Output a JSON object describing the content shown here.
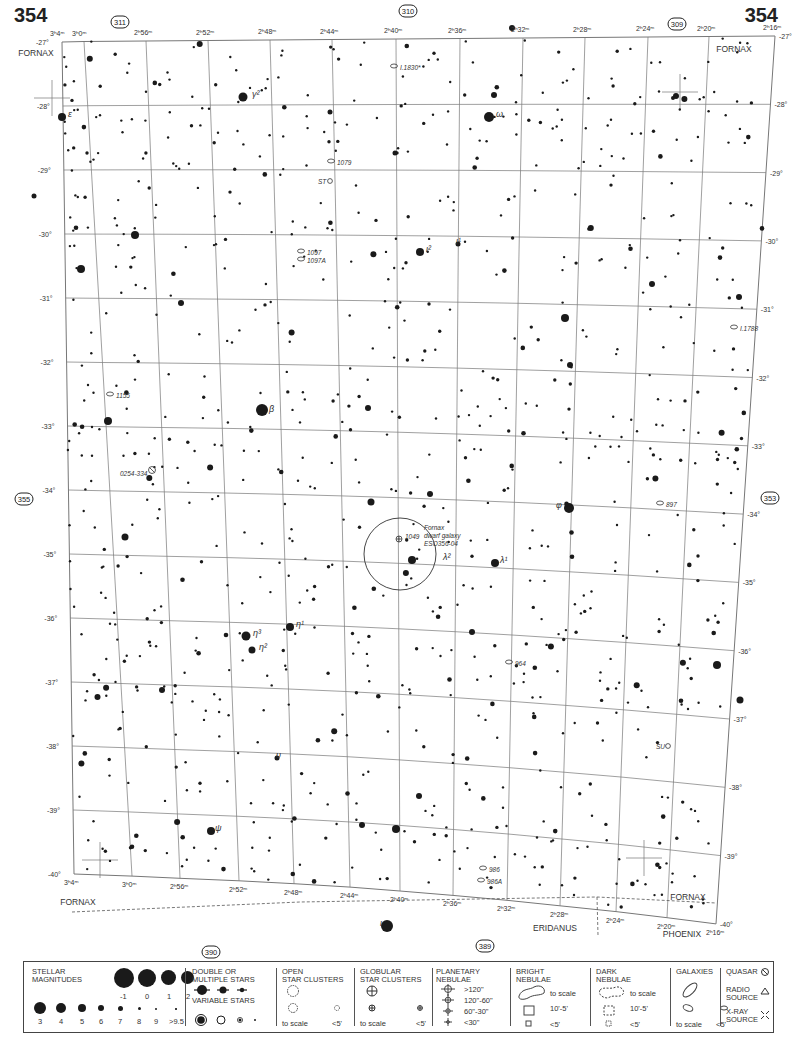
{
  "page": {
    "number_left": "354",
    "number_right": "354"
  },
  "adjacent_charts": {
    "top_left": "311",
    "top_center": "310",
    "top_right": "309",
    "left": "355",
    "right": "353",
    "bottom_left": "390",
    "bottom_right": "389"
  },
  "ra_labels_top": [
    "3h4m",
    "3h0m",
    "2h56m",
    "2h52m",
    "2h48m",
    "2h44m",
    "2h40m",
    "2h36m",
    "2h32m",
    "2h28m",
    "2h24m",
    "2h20m",
    "2h16m"
  ],
  "ra_labels_bottom": [
    "3h4m",
    "3h0m",
    "2h56m",
    "2h52m",
    "2h48m",
    "2h44m",
    "2h40m",
    "2h36m",
    "2h32m",
    "2h28m",
    "2h24m",
    "2h20m",
    "2h16m"
  ],
  "dec_labels": [
    "-27°",
    "-28°",
    "-29°",
    "-30°",
    "-31°",
    "-32°",
    "-33°",
    "-34°",
    "-35°",
    "-36°",
    "-37°",
    "-38°",
    "-39°",
    "-40°"
  ],
  "constellations": [
    {
      "name": "FORNAX",
      "x": 36,
      "y": 56
    },
    {
      "name": "FORNAX",
      "x": 734,
      "y": 52
    },
    {
      "name": "FORNAX",
      "x": 78,
      "y": 905
    },
    {
      "name": "FORNAX",
      "x": 688,
      "y": 900
    },
    {
      "name": "ERIDANUS",
      "x": 555,
      "y": 931
    },
    {
      "name": "PHOENIX",
      "x": 682,
      "y": 937
    }
  ],
  "labeled_objects": [
    {
      "label": "γ²",
      "x": 252,
      "y": 97,
      "type": "star"
    },
    {
      "label": "ε",
      "x": 68,
      "y": 117,
      "type": "star"
    },
    {
      "label": "ω",
      "x": 496,
      "y": 117,
      "type": "star"
    },
    {
      "label": "I.1830*",
      "x": 400,
      "y": 70,
      "type": "galaxy"
    },
    {
      "label": "1079",
      "x": 337,
      "y": 165,
      "type": "galaxy"
    },
    {
      "label": "ST",
      "x": 318,
      "y": 184,
      "type": "variable"
    },
    {
      "label": "1097",
      "x": 307,
      "y": 255,
      "type": "galaxy"
    },
    {
      "label": "1097A",
      "x": 307,
      "y": 263,
      "type": "galaxy"
    },
    {
      "label": "ι²",
      "x": 426,
      "y": 252,
      "type": "star"
    },
    {
      "label": "ι¹",
      "x": 456,
      "y": 244,
      "type": "star"
    },
    {
      "label": "I.1788",
      "x": 740,
      "y": 331,
      "type": "galaxy"
    },
    {
      "label": "1155",
      "x": 116,
      "y": 398,
      "type": "galaxy"
    },
    {
      "label": "β",
      "x": 269,
      "y": 412,
      "type": "star"
    },
    {
      "label": "0254-334",
      "x": 120,
      "y": 476,
      "type": "quasar"
    },
    {
      "label": "φ",
      "x": 556,
      "y": 508,
      "type": "star"
    },
    {
      "label": "897",
      "x": 666,
      "y": 507,
      "type": "galaxy"
    },
    {
      "label": "1049",
      "x": 405,
      "y": 539,
      "type": "globular"
    },
    {
      "label": "Fornax dwarf galaxy ESO356-04",
      "x": 424,
      "y": 530,
      "type": "galaxy"
    },
    {
      "label": "λ²",
      "x": 443,
      "y": 560,
      "type": "star"
    },
    {
      "label": "λ¹",
      "x": 500,
      "y": 563,
      "type": "star"
    },
    {
      "label": "η¹",
      "x": 296,
      "y": 627,
      "type": "star"
    },
    {
      "label": "η³",
      "x": 253,
      "y": 636,
      "type": "star"
    },
    {
      "label": "η²",
      "x": 259,
      "y": 650,
      "type": "star"
    },
    {
      "label": "964",
      "x": 515,
      "y": 666,
      "type": "galaxy"
    },
    {
      "label": "υ",
      "x": 276,
      "y": 758,
      "type": "star"
    },
    {
      "label": "SU",
      "x": 656,
      "y": 749,
      "type": "variable"
    },
    {
      "label": "ψ",
      "x": 215,
      "y": 831,
      "type": "star"
    },
    {
      "label": "986",
      "x": 489,
      "y": 872,
      "type": "galaxy"
    },
    {
      "label": "986A",
      "x": 487,
      "y": 884,
      "type": "galaxy"
    },
    {
      "label": "ι",
      "x": 380,
      "y": 926,
      "type": "star"
    }
  ],
  "legend": {
    "stellar_magnitudes": {
      "title": "STELLAR\nMAGNITUDES",
      "row1": [
        "-1",
        "0",
        "1",
        "2"
      ],
      "row2": [
        "3",
        "4",
        "5",
        "6",
        "7",
        "8",
        "9",
        ">9.5"
      ]
    },
    "double_stars": {
      "title": "DOUBLE OR\nMULTIPLE STARS"
    },
    "variable_stars": {
      "title": "VARIABLE STARS"
    },
    "open_clusters": {
      "title": "OPEN\nSTAR CLUSTERS",
      "to_scale": "to scale",
      "small": "<5'"
    },
    "globular_clusters": {
      "title": "GLOBULAR\nSTAR CLUSTERS",
      "to_scale": "to scale",
      "small": "<5'"
    },
    "planetary_nebulae": {
      "title": "PLANETARY\nNEBULAE",
      "sizes": [
        ">120\"",
        "120\"-60\"",
        "60\"-30\"",
        "<30\""
      ]
    },
    "bright_nebulae": {
      "title": "BRIGHT\nNEBULAE",
      "to_scale": "to scale",
      "mid": "10'-5'",
      "small": "<5'"
    },
    "dark_nebulae": {
      "title": "DARK\nNEBULAE",
      "to_scale": "to scale",
      "mid": "10'-5'",
      "small": "<5'"
    },
    "galaxies": {
      "title": "GALAXIES",
      "to_scale": "to scale",
      "small": "<5'"
    },
    "quasar": "QUASAR",
    "radio_source": "RADIO\nSOURCE",
    "xray_source": "X-RAY\nSOURCE"
  }
}
